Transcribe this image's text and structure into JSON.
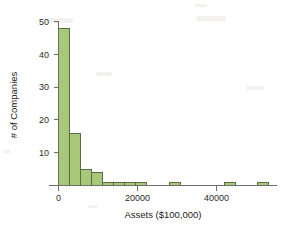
{
  "chart_data": {
    "type": "bar",
    "title": "",
    "subtitle": "",
    "xlabel": "Assets ($100,000)",
    "ylabel": "# of Companies",
    "grid": false,
    "legend": false,
    "legend_position": "none",
    "bar_fill_color": "#a7c878",
    "bar_edge_color": "#5d6b4a",
    "axis_color": "#6e6e6e",
    "background_color": "#ffffff",
    "bin_width": 2800,
    "xlim": [
      -1400,
      57000
    ],
    "ylim": [
      0,
      51
    ],
    "xticks": [
      0,
      20000,
      40000
    ],
    "xtick_labels": [
      "0",
      "20000",
      "40000"
    ],
    "yticks": [
      10,
      20,
      30,
      40,
      50
    ],
    "ytick_labels": [
      "10",
      "20",
      "30",
      "40",
      "50"
    ],
    "categories": [
      "0-2800",
      "2800-5600",
      "5600-8400",
      "8400-11200",
      "11200-14000",
      "14000-16800",
      "16800-19600",
      "19600-22400",
      "22400-25200",
      "25200-28000",
      "28000-30800",
      "30800-33600",
      "33600-36400",
      "36400-39200",
      "39200-42000",
      "42000-44800",
      "44800-47600",
      "47600-50400",
      "50400-53200",
      "53200-56000"
    ],
    "bin_left_edges": [
      0,
      2800,
      5600,
      8400,
      11200,
      14000,
      16800,
      19600,
      22400,
      25200,
      28000,
      30800,
      33600,
      36400,
      39200,
      42000,
      44800,
      47600,
      50400,
      53200
    ],
    "values": [
      48,
      16,
      5,
      4,
      1,
      1,
      1,
      1,
      0,
      0,
      1,
      0,
      0,
      0,
      0,
      1,
      0,
      0,
      1,
      0
    ]
  },
  "axes": {
    "y_title": "# of Companies",
    "x_title": "Assets ($100,000)"
  }
}
